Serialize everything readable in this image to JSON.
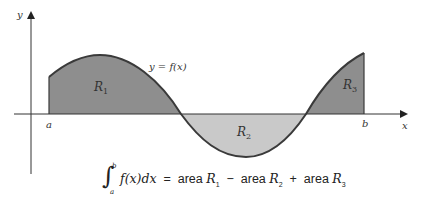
{
  "diagram": {
    "type": "definite-integral-signed-area",
    "axes": {
      "x_label": "x",
      "y_label": "y"
    },
    "bounds": {
      "lower": "a",
      "upper": "b"
    },
    "curve_label": "y = f(x)",
    "regions": [
      {
        "id": "R1",
        "label": "R",
        "sub": "1",
        "sign": "positive",
        "fill": "#8e8e8e"
      },
      {
        "id": "R2",
        "label": "R",
        "sub": "2",
        "sign": "negative",
        "fill": "#c9c9c9"
      },
      {
        "id": "R3",
        "label": "R",
        "sub": "3",
        "sign": "positive",
        "fill": "#8e8e8e"
      }
    ],
    "formula": {
      "integral_lower": "a",
      "integral_upper": "b",
      "integrand": "f(x)dx",
      "equals": "=",
      "term1": "area",
      "term1_var": "R",
      "term1_sub": "1",
      "op1": "−",
      "term2": "area",
      "term2_var": "R",
      "term2_sub": "2",
      "op2": "+",
      "term3": "area",
      "term3_var": "R",
      "term3_sub": "3"
    },
    "colors": {
      "curve": "#3a3a3a",
      "axis": "#333333",
      "dark_fill": "#8e8e8e",
      "light_fill": "#c9c9c9"
    }
  }
}
